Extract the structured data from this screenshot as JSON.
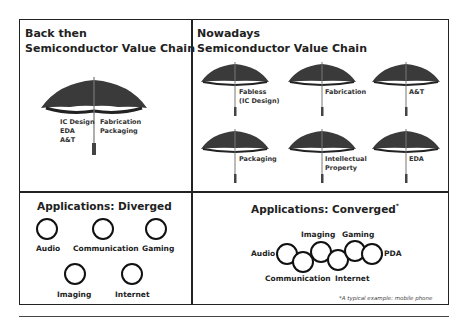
{
  "panels": {
    "back_then": {
      "title_line1": "Back then",
      "title_line2": "Semiconductor Value Chain",
      "umbrella_left_labels": [
        "IC Design",
        "EDA",
        "A&T"
      ],
      "umbrella_right_labels": [
        "Fabrication",
        "Packaging"
      ]
    },
    "nowadays": {
      "title_line1": "Nowadays",
      "title_line2": "Semiconductor Value Chain",
      "umbrellas": [
        {
          "line1": "Fabless",
          "line2": "(IC Design)"
        },
        {
          "line1": "Fabrication",
          "line2": ""
        },
        {
          "line1": "A&T",
          "line2": ""
        },
        {
          "line1": "Packaging",
          "line2": ""
        },
        {
          "line1": "Intellectual",
          "line2": "Property"
        },
        {
          "line1": "EDA",
          "line2": ""
        }
      ]
    },
    "diverged": {
      "title": "Applications: Diverged",
      "items": [
        "Audio",
        "Communication",
        "Gaming",
        "Imaging",
        "Internet"
      ]
    },
    "converged": {
      "title": "Applications: Converged",
      "title_mark": "*",
      "items_top": [
        "Imaging",
        "Gaming"
      ],
      "items_left": "Audio",
      "items_right": "PDA",
      "items_bottom": [
        "Communication",
        "Internet"
      ],
      "footnote": "*A typical example: mobile phone"
    }
  },
  "colors": {
    "border": "#222222",
    "umbrella": "#3a3a3a"
  }
}
